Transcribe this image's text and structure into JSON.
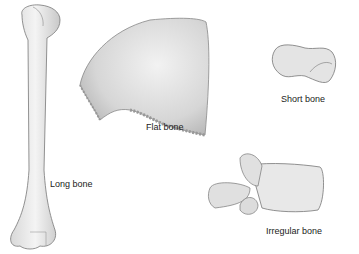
{
  "figure": {
    "labels": {
      "long_bone": "Long bone",
      "flat_bone": "Flat bone",
      "short_bone": "Short bone",
      "irregular_bone": "Irregular bone"
    }
  }
}
